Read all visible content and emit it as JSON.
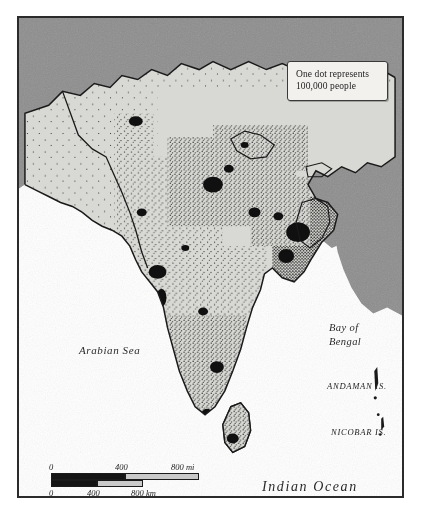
{
  "map": {
    "title": "South Asia population dot-density map",
    "legend": {
      "line1": "One dot represents",
      "line2": "100,000 people",
      "dot_value": 100000
    },
    "water_labels": {
      "arabian_sea": "Arabian Sea",
      "bay_of_bengal_line1": "Bay of",
      "bay_of_bengal_line2": "Bengal",
      "indian_ocean": "Indian Ocean"
    },
    "island_labels": {
      "andaman": "ANDAMAN IS.",
      "nicobar": "NICOBAR IS."
    },
    "scale": {
      "miles": {
        "unit": "mi",
        "ticks": [
          "0",
          "400",
          "800 mi"
        ]
      },
      "kilometers": {
        "unit": "km",
        "ticks": [
          "0",
          "400",
          "800 km"
        ]
      }
    },
    "colors": {
      "surround_land": "#8d8d8d",
      "mapped_land": "#d8d8d4",
      "ocean": "#ffffff",
      "border": "#1a1a1a",
      "dot": "#1b1b1b",
      "frame": "#2b2b2b",
      "legend_bg": "#f2f1ee"
    }
  }
}
